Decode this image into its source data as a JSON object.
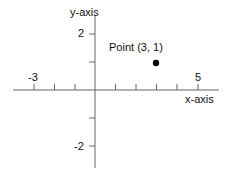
{
  "diagram": {
    "type": "coordinate-plane",
    "x_axis_label": "x-axis",
    "y_axis_label": "y-axis",
    "x_tick_labels": [
      {
        "value": -3,
        "text": "-3"
      },
      {
        "value": 5,
        "text": "5"
      }
    ],
    "y_tick_labels": [
      {
        "value": 2,
        "text": "2"
      },
      {
        "value": -2,
        "text": "-2"
      }
    ],
    "x_ticks": [
      -3,
      -2,
      -1,
      1,
      2,
      3,
      4,
      5
    ],
    "y_ticks": [
      2,
      1,
      -1,
      -2
    ],
    "point": {
      "x": 3,
      "y": 1,
      "label": "Point (3, 1)"
    },
    "colors": {
      "axis": "#555555",
      "point": "#000000",
      "text": "#111111"
    }
  }
}
